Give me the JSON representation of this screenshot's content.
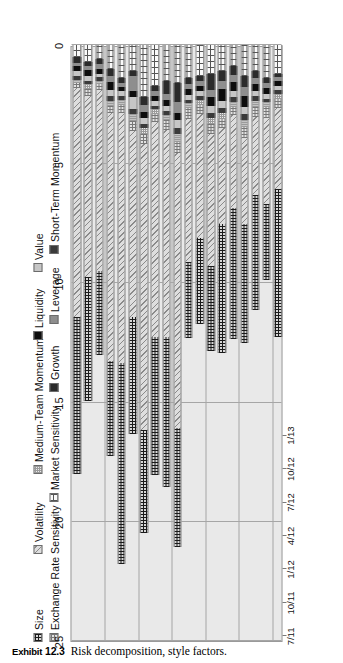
{
  "caption": {
    "exhibit_label": "Exhibit",
    "exhibit_number": "12.3",
    "text": "Risk decomposition, style factors."
  },
  "legend": {
    "row1": [
      {
        "name": "size",
        "label": "Size",
        "pattern": "crosshatch-dark",
        "color": "#1a1a1a"
      },
      {
        "name": "volatility",
        "label": "Volatility",
        "pattern": "diagonal-lines",
        "color": "#8a8a8a"
      },
      {
        "name": "medium-team-momentum",
        "label": "Medium-Team Momentum",
        "pattern": "fine-grid",
        "color": "#9a9a9a"
      },
      {
        "name": "liquidity",
        "label": "Liquidity",
        "pattern": "solid",
        "color": "#0d0d0d"
      },
      {
        "name": "value",
        "label": "Value",
        "pattern": "solid",
        "color": "#c6c6c6"
      }
    ],
    "row2": [
      {
        "name": "exchange-rate-sensitivity",
        "label": "Exchange Rate Sensitivity",
        "pattern": "grid-gray",
        "color": "#777777"
      },
      {
        "name": "market-sensitivity",
        "label": "Market Sensitivity",
        "pattern": "dotted-dashed",
        "color": "#555555"
      },
      {
        "name": "growth",
        "label": "Growth",
        "pattern": "solid",
        "color": "#2b2b2b"
      },
      {
        "name": "leverage",
        "label": "Leverage",
        "pattern": "solid",
        "color": "#8e8e8e"
      },
      {
        "name": "short-term-momentum",
        "label": "Short-Term Momentum",
        "pattern": "solid",
        "color": "#3a3a3a"
      }
    ]
  },
  "chart_data": {
    "type": "bar",
    "subtype": "stacked-horizontal",
    "title": "Risk decomposition, style factors.",
    "xlabel": "",
    "ylabel": "",
    "ylim": [
      0,
      25
    ],
    "yticks": [
      0,
      5,
      10,
      15,
      20,
      25
    ],
    "ytick_labels": [
      "0",
      "5",
      "10",
      "15",
      "20",
      "25"
    ],
    "grid": true,
    "grid_axis": "value",
    "legend_position": "top-left",
    "orientation": "rotated-90-ccw",
    "axis_note": "value axis 0 at right in rotated view, increasing leftward",
    "categories": [
      "7/11",
      "",
      "",
      "10/11",
      "",
      "",
      "1/12",
      "",
      "",
      "4/12",
      "",
      "",
      "7/12",
      "",
      "",
      "10/12",
      "",
      "",
      "1/13"
    ],
    "date_ticks": [
      "7/11",
      "10/11",
      "1/12",
      "4/12",
      "7/12",
      "10/12",
      "1/13"
    ],
    "date_tick_index": [
      0,
      3,
      6,
      9,
      12,
      15,
      18
    ],
    "series": [
      {
        "name": "Market Sensitivity",
        "key": "market-sensitivity",
        "pattern": "dotted-dashed",
        "values": [
          0.5,
          0.7,
          0.6,
          1.0,
          1.4,
          1.1,
          2.2,
          1.7,
          1.5,
          1.6,
          1.4,
          1.3,
          1.2,
          1.1,
          0.9,
          1.3,
          1.1,
          1.4,
          1.2
        ]
      },
      {
        "name": "Growth",
        "key": "growth",
        "pattern": "solid",
        "values": [
          0.25,
          0.2,
          0.2,
          0.3,
          0.2,
          0.2,
          0.3,
          0.25,
          0.55,
          0.8,
          0.25,
          0.2,
          0.7,
          0.4,
          0.35,
          0.45,
          0.3,
          0.2,
          0.15
        ]
      },
      {
        "name": "Leverage",
        "key": "leverage",
        "pattern": "solid",
        "values": [
          0.15,
          0.15,
          0.2,
          0.25,
          0.15,
          0.65,
          0.3,
          0.2,
          0.25,
          0.45,
          0.2,
          0.2,
          0.3,
          0.35,
          0.3,
          0.4,
          0.25,
          0.2,
          0.15
        ]
      },
      {
        "name": "Liquidity",
        "key": "liquidity",
        "pattern": "solid",
        "values": [
          0.2,
          0.25,
          0.2,
          0.35,
          0.2,
          0.25,
          0.25,
          0.2,
          0.25,
          0.3,
          0.25,
          0.25,
          0.35,
          0.5,
          0.4,
          0.45,
          0.3,
          0.25,
          0.2
        ]
      },
      {
        "name": "Value",
        "key": "value",
        "pattern": "solid",
        "values": [
          0.2,
          0.2,
          0.15,
          0.25,
          0.2,
          0.5,
          0.25,
          0.2,
          0.2,
          0.35,
          0.2,
          0.2,
          0.3,
          0.3,
          0.25,
          0.3,
          0.2,
          0.2,
          0.2
        ]
      },
      {
        "name": "Short-Term Momentum",
        "key": "short-term-momentum",
        "pattern": "solid",
        "values": [
          0.15,
          0.15,
          0.15,
          0.2,
          0.15,
          0.2,
          0.2,
          0.15,
          0.2,
          0.25,
          0.15,
          0.15,
          0.2,
          0.2,
          0.2,
          0.25,
          0.2,
          0.15,
          0.15
        ]
      },
      {
        "name": "Medium-Team Momentum",
        "key": "medium-team-momentum",
        "pattern": "fine-grid",
        "values": [
          0.15,
          0.2,
          0.15,
          0.2,
          0.2,
          0.3,
          0.25,
          0.2,
          0.2,
          0.3,
          0.2,
          0.2,
          0.25,
          0.25,
          0.2,
          0.3,
          0.25,
          0.2,
          0.2
        ]
      },
      {
        "name": "Exchange Rate Sensitivity",
        "key": "exchange-rate-sensitivity",
        "pattern": "grid-gray",
        "values": [
          0.2,
          0.3,
          0.25,
          0.3,
          0.35,
          0.4,
          0.4,
          0.35,
          0.4,
          0.5,
          0.45,
          0.4,
          0.45,
          0.4,
          0.35,
          0.45,
          0.4,
          0.45,
          0.4
        ]
      },
      {
        "name": "Volatility",
        "key": "volatility",
        "pattern": "diagonal-lines",
        "values": [
          9.6,
          7.6,
          7.6,
          10.4,
          10.5,
          7.8,
          12.0,
          9.0,
          8.7,
          11.5,
          6.0,
          5.2,
          5.5,
          4.0,
          3.9,
          3.6,
          3.3,
          3.6,
          3.4
        ]
      },
      {
        "name": "Size",
        "key": "size",
        "pattern": "crosshatch-dark",
        "values": [
          6.6,
          5.2,
          3.5,
          4.0,
          8.4,
          4.9,
          4.3,
          5.8,
          6.3,
          5.0,
          3.2,
          3.6,
          3.6,
          5.4,
          5.5,
          5.0,
          4.8,
          3.2,
          6.2
        ]
      }
    ],
    "totals": [
      18.0,
      14.95,
      12.86,
      17.25,
      21.65,
      16.3,
      20.47,
      17.85,
      18.5,
      21.05,
      12.3,
      11.7,
      12.85,
      12.9,
      12.35,
      12.45,
      11.09,
      9.85,
      12.25
    ]
  }
}
